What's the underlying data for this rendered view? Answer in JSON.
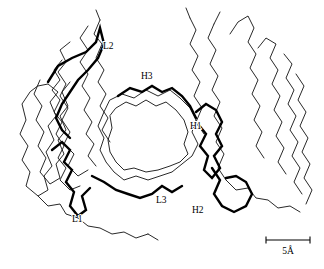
{
  "figure": {
    "background_color": "#ffffff",
    "line_color": "#000000",
    "width": 324,
    "height": 269
  },
  "labels": [
    {
      "id": "L2",
      "text": "L2",
      "x": 103,
      "y": 49
    },
    {
      "id": "H3",
      "text": "H3",
      "x": 141,
      "y": 79
    },
    {
      "id": "H1",
      "text": "H1",
      "x": 190,
      "y": 129
    },
    {
      "id": "L3",
      "text": "L3",
      "x": 156,
      "y": 203
    },
    {
      "id": "H2",
      "text": "H2",
      "x": 192,
      "y": 213
    },
    {
      "id": "L1",
      "text": "L1",
      "x": 72,
      "y": 222
    }
  ],
  "scale_bar": {
    "label": "5Å",
    "x_start": 266,
    "x_end": 310,
    "y": 240,
    "tick_height": 7,
    "label_x": 288,
    "label_y": 254
  },
  "chains": {
    "light_domain_framework": [
      "M 30 92 L 22 104 L 26 120 L 20 134 L 28 146 L 22 160 L 30 172 L 26 186 L 38 196 L 48 190 L 44 176 L 52 166 L 46 152 L 54 140 L 48 126 L 56 116 L 50 102 L 58 92 L 48 84 L 38 86 Z",
      "M 40 80 L 34 94 L 42 106 L 36 120 L 44 132 L 38 146 L 46 158 L 40 172 L 50 184 L 60 178 L 56 164 L 64 154 L 58 140 L 66 130 L 60 116 L 68 106 L 62 92 L 70 82",
      "M 62 60 L 54 70 L 60 80 L 52 90 L 60 100 L 54 112 L 62 122 L 56 134 L 64 146 L 58 158 L 66 168 L 60 180 L 70 190 L 80 186",
      "M 70 42 L 60 50 L 66 62 L 58 72 L 66 84 L 60 96 L 68 108 L 62 120 L 70 132 L 64 144 L 74 154 L 68 166 L 78 176 L 88 170",
      "M 88 26 L 80 38 L 88 50 L 80 62 L 88 74 L 82 86 L 90 98 L 84 110 L 92 122 L 86 134 L 94 144 L 88 156 L 96 166",
      "M 100 20 L 94 34 L 102 44 L 96 58 L 104 70 L 98 82 L 106 94 L 100 106 L 108 118 L 102 130 L 110 142",
      "M 38 196 L 48 206 L 60 204 L 66 214 L 78 218 L 88 226 L 100 228 L 112 234 L 124 232 L 136 238 L 148 234"
    ],
    "heavy_domain_framework": [
      "M 230 34 L 238 22 L 248 16 L 254 28 L 248 42 L 256 54 L 250 68 L 258 80 L 252 94 L 260 106 L 254 120 L 262 132 L 256 146 L 264 158",
      "M 258 48 L 266 38 L 276 44 L 270 58 L 278 70 L 272 84 L 280 96 L 274 110 L 282 122 L 276 136 L 284 148 L 278 162 L 286 174",
      "M 284 54 L 292 64 L 286 78 L 294 90 L 288 104 L 296 116 L 290 130 L 298 142 L 292 156 L 300 168 L 294 182 L 302 194",
      "M 296 74 L 304 86 L 298 100 L 306 112 L 300 126 L 308 138 L 302 152 L 310 164 L 304 178 L 312 190 L 306 204",
      "M 214 24 L 208 38 L 216 50 L 210 64 L 218 76 L 212 90 L 220 102 L 214 116 L 222 128 L 216 142 L 224 154 L 218 168 L 226 180",
      "M 190 18 L 196 30 L 190 44 L 198 56 L 192 70 L 200 82 L 194 96 L 202 108 L 196 122 L 204 134",
      "M 226 180 L 236 190 L 248 188 L 256 198 L 268 200 L 278 208 L 290 206 L 300 212"
    ],
    "cdr_loops": [
      {
        "id": "L1",
        "path": "M 52 150 L 62 142 L 70 150 L 64 162 L 72 170 L 66 182 L 74 192 L 70 206 L 78 216 L 86 210 L 82 196 L 90 188"
      },
      {
        "id": "L2",
        "path": "M 48 82 L 58 66 L 72 58 L 86 52 L 96 42 L 100 28 L 104 44 L 98 58 L 88 70 L 78 80 L 70 92 L 62 104 L 56 118 L 62 130 L 70 138"
      },
      {
        "id": "L3",
        "path": "M 92 176 L 104 182 L 116 190 L 128 194 L 140 198 L 152 194 L 162 186 L 172 192 L 182 186"
      },
      {
        "id": "H1",
        "path": "M 196 112 L 206 104 L 216 110 L 222 122 L 216 134 L 222 146 L 214 156 L 220 168 L 212 178 L 204 170 L 208 156 L 200 146 L 206 134 L 198 124"
      },
      {
        "id": "H2",
        "path": "M 212 168 L 220 180 L 214 194 L 222 206 L 234 212 L 246 206 L 252 194 L 246 182 L 236 176 L 226 178"
      },
      {
        "id": "H3",
        "path": "M 118 96 L 130 88 L 142 92 L 152 86 L 162 92 L 172 88 L 182 96 L 190 106 L 196 118"
      }
    ],
    "binding_site_rim": [
      "M 110 100 L 122 94 L 134 98 L 146 90 L 158 96 L 170 90 L 180 98 L 190 108 L 196 120 L 192 132 L 198 144 L 192 156 L 182 164 L 172 172 L 160 176 L 148 180 L 136 176 L 124 180 L 114 172 L 106 162 L 100 150 L 104 138 L 98 126 L 104 112 Z",
      "M 116 108 L 126 102 L 136 106 L 146 100 L 156 106 L 166 102 L 176 110 L 184 120 L 188 132 L 184 144 L 188 154 L 180 162 L 170 166 L 158 170 L 146 172 L 134 168 L 124 170 L 116 162 L 110 152 L 108 140 L 112 128 L 110 116 Z"
    ],
    "termini": [
      "M 190 18 L 186 8",
      "M 214 24 L 220 12",
      "M 100 20 L 96 10",
      "M 148 234 L 158 240"
    ]
  }
}
